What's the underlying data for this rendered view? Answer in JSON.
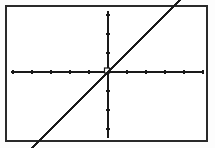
{
  "view": {
    "title": "Graphing calculator plot of a linear function",
    "background_color": "#ffffff",
    "frame_color": "#2a2a2a",
    "plot_color": "#1a1a1a",
    "frame": {
      "x": 5,
      "y": 5,
      "width": 203,
      "height": 137,
      "border_width": 2
    }
  },
  "chart_data": {
    "type": "line",
    "title": "",
    "xlabel": "",
    "ylabel": "",
    "series": [
      {
        "name": "y = x",
        "equation": "y = x",
        "slope": 1,
        "intercept": 0,
        "x": [
          -5.1,
          -4,
          -3,
          -2,
          -1,
          0,
          1,
          2,
          3,
          4,
          4.4
        ],
        "y": [
          -5.1,
          -4,
          -3,
          -2,
          -1,
          0,
          1,
          2,
          3,
          4,
          4.4
        ]
      }
    ],
    "xlim": [
      -5.2,
      5.1
    ],
    "ylim": [
      -4.7,
      4.7
    ],
    "xticks": [
      -5,
      -4,
      -3,
      -2,
      -1,
      1,
      2,
      3,
      4,
      5
    ],
    "yticks": [
      -4,
      -3,
      -2,
      -1,
      1,
      2,
      3,
      4
    ],
    "tick_labels_shown": false,
    "grid": false,
    "legend": "none",
    "axes_shown": true,
    "origin_marker": true
  },
  "geometry": {
    "x_axis": {
      "y": 72,
      "x_start": 11,
      "x_end": 203,
      "thickness": 2
    },
    "y_axis": {
      "x": 108,
      "y_start": 11,
      "y_end": 138,
      "thickness": 2
    },
    "x_tick_spacing": 19,
    "y_tick_spacing": 19,
    "tick_length": 4,
    "line_start": {
      "x": 13,
      "y": 131
    },
    "line_end": {
      "x": 193,
      "y": 13
    }
  },
  "labels": {
    "plot_region": "plot-region",
    "equation_text": "y = x"
  }
}
